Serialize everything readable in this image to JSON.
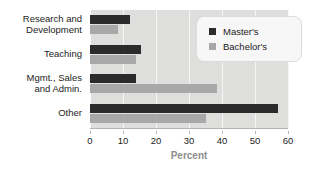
{
  "chart_data": {
    "type": "bar",
    "orientation": "horizontal",
    "title": "",
    "xlabel": "Percent",
    "ylabel": "",
    "xlim": [
      0,
      60
    ],
    "xticks": [
      0,
      10,
      20,
      30,
      40,
      50,
      60
    ],
    "grid": true,
    "legend_position": "top-right",
    "categories": [
      "Research and\nDevelopment",
      "Teaching",
      "Mgmt., Sales\nand Admin.",
      "Other"
    ],
    "series": [
      {
        "name": "Master's",
        "color": "#2b2b2b",
        "values": [
          12,
          15.5,
          14,
          57
        ]
      },
      {
        "name": "Bachelor's",
        "color": "#a8a8a8",
        "values": [
          8.5,
          14,
          38.5,
          35
        ]
      }
    ]
  },
  "colors": {
    "plot_background": "#dededc",
    "gridline": "#f6f6f6",
    "axis_line": "#b4b4b4",
    "text": "#1c1c1c",
    "axis_title_text": "#8d8d8d",
    "legend_background": "#f7f7f7",
    "legend_border": "#dcdcdc"
  }
}
